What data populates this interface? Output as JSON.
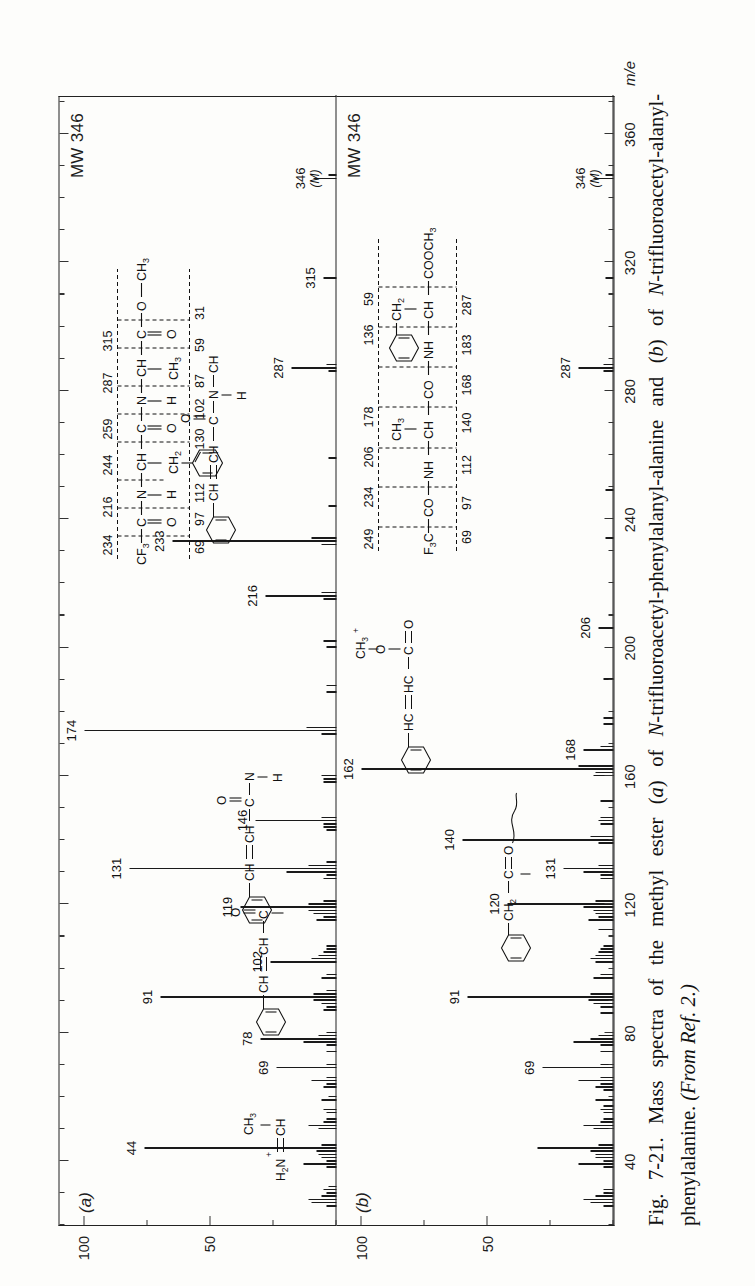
{
  "figure": {
    "number": "Fig. 7-21.",
    "caption_text": "Mass spectra of the methyl ester (a) of N-trifluoroacetyl-phenylalanyl-alanine and (b) of N-trifluoroacetyl-alanyl-phenylalanine.",
    "caption_source": "(From Ref. 2.)",
    "caption_full": "Fig. 7-21. Mass spectra of the methyl ester (a) of N-trifluoroacetyl-phenylalanyl-alanine and (b) of N-trifluoroacetyl-alanyl-phenylalanine. (From Ref. 2.)"
  },
  "axes": {
    "x_title": "m/e",
    "x_ticks_major": [
      40,
      80,
      120,
      160,
      200,
      240,
      280,
      320,
      360
    ],
    "x_tick_labels": [
      "40",
      "80",
      "120",
      "160",
      "200",
      "240",
      "280",
      "320",
      "360"
    ],
    "x_min": 20,
    "x_max": 372,
    "y_title": "Rel. Int.",
    "y_title_arrow": "←",
    "y_ticks": [
      50,
      100
    ],
    "y_tick_labels": [
      "50",
      "100"
    ],
    "y_min": 0,
    "y_max": 100
  },
  "panels": [
    {
      "id": "a",
      "label": "(a)",
      "mw_label": "MW 346",
      "compound": "methyl ester of N-trifluoroacetyl-phenylalanyl-alanine",
      "fragment_scheme": {
        "backbone": [
          "CF3",
          "C",
          "N",
          "CH",
          "C",
          "N",
          "CH",
          "C",
          "O",
          "CH3"
        ],
        "substituents": [
          "=O",
          "—H",
          "—CH2—C6H5",
          "=O",
          "—H",
          "—CH3",
          "=O"
        ],
        "upper_masses": [
          "234",
          "216",
          "244",
          "259",
          "287",
          "315"
        ],
        "lower_masses": [
          "69",
          "97",
          "112",
          "130",
          "102",
          "87",
          "59",
          "31"
        ]
      },
      "annotations": [
        {
          "mz": 44,
          "text": "44",
          "struct": "H2N+=CH—CH3"
        },
        {
          "mz": 69,
          "text": "69",
          "curved": true
        },
        {
          "mz": 78,
          "text": "78"
        },
        {
          "mz": 91,
          "text": "91"
        },
        {
          "mz": 102,
          "text": "102"
        },
        {
          "mz": 119,
          "text": "119"
        },
        {
          "mz": 131,
          "text": "131",
          "struct": "C6H5—CH=CH—C≡O+"
        },
        {
          "mz": 146,
          "text": "146"
        },
        {
          "mz": 174,
          "text": "174",
          "struct": "C6H5—CH=CH—CO—NH—CH—CH3"
        },
        {
          "mz": 216,
          "text": "216"
        },
        {
          "mz": 233,
          "text": "233",
          "struct": "C6H5—CH=CH—CO—NH—CH(CH3)—COOCH3"
        },
        {
          "mz": 287,
          "text": "287"
        },
        {
          "mz": 315,
          "text": "315",
          "curved": true
        },
        {
          "mz": 346,
          "text": "346",
          "text2": "(M)",
          "curved": true
        }
      ],
      "peaks": [
        {
          "mz": 26,
          "i": 4
        },
        {
          "mz": 27,
          "i": 10
        },
        {
          "mz": 28,
          "i": 11
        },
        {
          "mz": 29,
          "i": 6
        },
        {
          "mz": 30,
          "i": 4
        },
        {
          "mz": 31,
          "i": 5
        },
        {
          "mz": 32,
          "i": 3
        },
        {
          "mz": 38,
          "i": 4
        },
        {
          "mz": 39,
          "i": 13
        },
        {
          "mz": 40,
          "i": 4
        },
        {
          "mz": 41,
          "i": 6
        },
        {
          "mz": 42,
          "i": 7
        },
        {
          "mz": 43,
          "i": 8
        },
        {
          "mz": 44,
          "i": 76
        },
        {
          "mz": 45,
          "i": 6
        },
        {
          "mz": 50,
          "i": 7
        },
        {
          "mz": 51,
          "i": 11
        },
        {
          "mz": 52,
          "i": 5
        },
        {
          "mz": 53,
          "i": 4
        },
        {
          "mz": 55,
          "i": 4
        },
        {
          "mz": 56,
          "i": 5
        },
        {
          "mz": 59,
          "i": 6
        },
        {
          "mz": 60,
          "i": 3
        },
        {
          "mz": 63,
          "i": 5
        },
        {
          "mz": 64,
          "i": 4
        },
        {
          "mz": 65,
          "i": 10
        },
        {
          "mz": 66,
          "i": 4
        },
        {
          "mz": 69,
          "i": 24
        },
        {
          "mz": 70,
          "i": 4
        },
        {
          "mz": 74,
          "i": 4
        },
        {
          "mz": 76,
          "i": 4
        },
        {
          "mz": 77,
          "i": 13
        },
        {
          "mz": 78,
          "i": 30
        },
        {
          "mz": 79,
          "i": 7
        },
        {
          "mz": 80,
          "i": 4
        },
        {
          "mz": 87,
          "i": 5
        },
        {
          "mz": 88,
          "i": 4
        },
        {
          "mz": 89,
          "i": 6
        },
        {
          "mz": 90,
          "i": 9
        },
        {
          "mz": 91,
          "i": 70
        },
        {
          "mz": 92,
          "i": 9
        },
        {
          "mz": 93,
          "i": 4
        },
        {
          "mz": 97,
          "i": 6
        },
        {
          "mz": 98,
          "i": 4
        },
        {
          "mz": 102,
          "i": 26
        },
        {
          "mz": 103,
          "i": 10
        },
        {
          "mz": 104,
          "i": 7
        },
        {
          "mz": 105,
          "i": 5
        },
        {
          "mz": 106,
          "i": 4
        },
        {
          "mz": 107,
          "i": 4
        },
        {
          "mz": 115,
          "i": 8
        },
        {
          "mz": 116,
          "i": 5
        },
        {
          "mz": 117,
          "i": 9
        },
        {
          "mz": 118,
          "i": 11
        },
        {
          "mz": 119,
          "i": 38
        },
        {
          "mz": 120,
          "i": 11
        },
        {
          "mz": 121,
          "i": 5
        },
        {
          "mz": 128,
          "i": 5
        },
        {
          "mz": 129,
          "i": 4
        },
        {
          "mz": 130,
          "i": 20
        },
        {
          "mz": 131,
          "i": 82
        },
        {
          "mz": 132,
          "i": 11
        },
        {
          "mz": 133,
          "i": 4
        },
        {
          "mz": 143,
          "i": 4
        },
        {
          "mz": 144,
          "i": 5
        },
        {
          "mz": 145,
          "i": 5
        },
        {
          "mz": 146,
          "i": 32
        },
        {
          "mz": 147,
          "i": 6
        },
        {
          "mz": 158,
          "i": 5
        },
        {
          "mz": 159,
          "i": 5
        },
        {
          "mz": 160,
          "i": 6
        },
        {
          "mz": 173,
          "i": 6
        },
        {
          "mz": 174,
          "i": 100
        },
        {
          "mz": 175,
          "i": 12
        },
        {
          "mz": 186,
          "i": 4
        },
        {
          "mz": 188,
          "i": 4
        },
        {
          "mz": 200,
          "i": 4
        },
        {
          "mz": 202,
          "i": 5
        },
        {
          "mz": 215,
          "i": 5
        },
        {
          "mz": 216,
          "i": 28
        },
        {
          "mz": 217,
          "i": 6
        },
        {
          "mz": 232,
          "i": 6
        },
        {
          "mz": 233,
          "i": 65
        },
        {
          "mz": 234,
          "i": 10
        },
        {
          "mz": 244,
          "i": 3
        },
        {
          "mz": 259,
          "i": 3
        },
        {
          "mz": 286,
          "i": 3
        },
        {
          "mz": 287,
          "i": 18
        },
        {
          "mz": 288,
          "i": 4
        },
        {
          "mz": 315,
          "i": 5
        },
        {
          "mz": 346,
          "i": 9
        },
        {
          "mz": 347,
          "i": 3
        }
      ]
    },
    {
      "id": "b",
      "label": "(b)",
      "mw_label": "MW 346",
      "compound": "methyl ester of N-trifluoroacetyl-alanyl-phenylalanine",
      "fragment_scheme": {
        "formula_line": "F3C—CO—NH—CH—CO—NH—CH—COOCH3",
        "substituent_1": "CH3",
        "substituent_2": "CH2—C6H5",
        "upper_masses": [
          "249",
          "234",
          "206",
          "178",
          "136",
          "59"
        ],
        "lower_masses": [
          "69",
          "97",
          "112",
          "140",
          "168",
          "183",
          "287"
        ]
      },
      "annotations": [
        {
          "mz": 69,
          "text": "69"
        },
        {
          "mz": 91,
          "text": "91"
        },
        {
          "mz": 120,
          "text": "120"
        },
        {
          "mz": 131,
          "text": "131",
          "curved": true
        },
        {
          "mz": 140,
          "text": "140"
        },
        {
          "mz": 162,
          "text": "162",
          "struct": "C6H5—HC=HC—C(=O)—O—CH3"
        },
        {
          "mz": 168,
          "text": "168",
          "curved": true
        },
        {
          "mz": 206,
          "text": "206"
        },
        {
          "mz": 287,
          "text": "287"
        },
        {
          "mz": 346,
          "text": "346",
          "text2": "(M)",
          "curved": true
        }
      ],
      "structure_fragment": "C6H5—CH2—C≡O+",
      "peaks": [
        {
          "mz": 26,
          "i": 4
        },
        {
          "mz": 27,
          "i": 9
        },
        {
          "mz": 28,
          "i": 12
        },
        {
          "mz": 29,
          "i": 7
        },
        {
          "mz": 30,
          "i": 4
        },
        {
          "mz": 31,
          "i": 4
        },
        {
          "mz": 38,
          "i": 4
        },
        {
          "mz": 39,
          "i": 14
        },
        {
          "mz": 40,
          "i": 4
        },
        {
          "mz": 41,
          "i": 7
        },
        {
          "mz": 42,
          "i": 7
        },
        {
          "mz": 43,
          "i": 9
        },
        {
          "mz": 44,
          "i": 30
        },
        {
          "mz": 45,
          "i": 6
        },
        {
          "mz": 50,
          "i": 8
        },
        {
          "mz": 51,
          "i": 12
        },
        {
          "mz": 52,
          "i": 5
        },
        {
          "mz": 53,
          "i": 4
        },
        {
          "mz": 55,
          "i": 4
        },
        {
          "mz": 56,
          "i": 5
        },
        {
          "mz": 57,
          "i": 4
        },
        {
          "mz": 59,
          "i": 7
        },
        {
          "mz": 62,
          "i": 4
        },
        {
          "mz": 63,
          "i": 7
        },
        {
          "mz": 64,
          "i": 5
        },
        {
          "mz": 65,
          "i": 14
        },
        {
          "mz": 66,
          "i": 5
        },
        {
          "mz": 69,
          "i": 28
        },
        {
          "mz": 70,
          "i": 5
        },
        {
          "mz": 74,
          "i": 5
        },
        {
          "mz": 76,
          "i": 5
        },
        {
          "mz": 77,
          "i": 16
        },
        {
          "mz": 78,
          "i": 9
        },
        {
          "mz": 79,
          "i": 6
        },
        {
          "mz": 86,
          "i": 5
        },
        {
          "mz": 88,
          "i": 5
        },
        {
          "mz": 89,
          "i": 8
        },
        {
          "mz": 90,
          "i": 10
        },
        {
          "mz": 91,
          "i": 58
        },
        {
          "mz": 92,
          "i": 9
        },
        {
          "mz": 97,
          "i": 8
        },
        {
          "mz": 98,
          "i": 5
        },
        {
          "mz": 102,
          "i": 7
        },
        {
          "mz": 103,
          "i": 9
        },
        {
          "mz": 104,
          "i": 7
        },
        {
          "mz": 105,
          "i": 6
        },
        {
          "mz": 106,
          "i": 5
        },
        {
          "mz": 107,
          "i": 4
        },
        {
          "mz": 112,
          "i": 6
        },
        {
          "mz": 115,
          "i": 10
        },
        {
          "mz": 116,
          "i": 6
        },
        {
          "mz": 117,
          "i": 7
        },
        {
          "mz": 118,
          "i": 8
        },
        {
          "mz": 119,
          "i": 12
        },
        {
          "mz": 120,
          "i": 42
        },
        {
          "mz": 121,
          "i": 7
        },
        {
          "mz": 128,
          "i": 5
        },
        {
          "mz": 129,
          "i": 5
        },
        {
          "mz": 130,
          "i": 12
        },
        {
          "mz": 131,
          "i": 20
        },
        {
          "mz": 132,
          "i": 6
        },
        {
          "mz": 139,
          "i": 6
        },
        {
          "mz": 140,
          "i": 60
        },
        {
          "mz": 141,
          "i": 9
        },
        {
          "mz": 145,
          "i": 5
        },
        {
          "mz": 146,
          "i": 6
        },
        {
          "mz": 147,
          "i": 5
        },
        {
          "mz": 152,
          "i": 5
        },
        {
          "mz": 160,
          "i": 8
        },
        {
          "mz": 161,
          "i": 7
        },
        {
          "mz": 162,
          "i": 100
        },
        {
          "mz": 163,
          "i": 14
        },
        {
          "mz": 168,
          "i": 12
        },
        {
          "mz": 169,
          "i": 5
        },
        {
          "mz": 176,
          "i": 4
        },
        {
          "mz": 178,
          "i": 4
        },
        {
          "mz": 190,
          "i": 4
        },
        {
          "mz": 206,
          "i": 6
        },
        {
          "mz": 234,
          "i": 3
        },
        {
          "mz": 249,
          "i": 3
        },
        {
          "mz": 286,
          "i": 4
        },
        {
          "mz": 287,
          "i": 14
        },
        {
          "mz": 288,
          "i": 4
        },
        {
          "mz": 315,
          "i": 3
        },
        {
          "mz": 346,
          "i": 8
        },
        {
          "mz": 347,
          "i": 3
        }
      ]
    }
  ],
  "chart_data": {
    "type": "line",
    "title": "Mass spectra of the methyl ester (a) of N-trifluoroacetyl-phenylalanyl-alanine and (b) of N-trifluoroacetyl-alanyl-phenylalanine.",
    "xlabel": "m/e",
    "ylabel": "Rel. Int.",
    "xlim": [
      20,
      372
    ],
    "ylim": [
      0,
      100
    ],
    "grid": false,
    "legend": "none",
    "xticks": [
      40,
      80,
      120,
      160,
      200,
      240,
      280,
      320,
      360
    ],
    "yticks": [
      50,
      100
    ],
    "series": [
      {
        "name": "(a) N-trifluoroacetyl-phenylalanyl-alanine methyl ester, MW 346",
        "labeled_peaks": [
          44,
          69,
          78,
          91,
          102,
          119,
          131,
          146,
          174,
          216,
          233,
          287,
          315,
          346
        ],
        "base_peak_mz": 174
      },
      {
        "name": "(b) N-trifluoroacetyl-alanyl-phenylalanine methyl ester, MW 346",
        "labeled_peaks": [
          69,
          91,
          120,
          131,
          140,
          162,
          168,
          206,
          287,
          346
        ],
        "base_peak_mz": 162
      }
    ]
  }
}
